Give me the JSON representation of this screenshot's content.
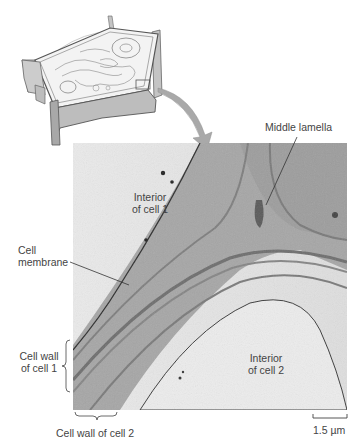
{
  "figure": {
    "type": "plant cell wall micrograph diagram",
    "inset": {
      "description": "3D drawing of plant cell with organelles, boxed region at lower right corner of cell wall"
    },
    "arrow": {
      "from": "inset-box",
      "to": "micrograph",
      "color": "#a9a9a9"
    },
    "labels": {
      "middle_lamella": "Middle lamella",
      "interior_cell1_line1": "Interior",
      "interior_cell1_line2": "of cell 1",
      "cell_membrane_line1": "Cell",
      "cell_membrane_line2": "membrane",
      "cell_wall_1_line1": "Cell wall",
      "cell_wall_1_line2": "of cell 1",
      "interior_cell2_line1": "Interior",
      "interior_cell2_line2": "of cell 2",
      "cell_wall_2": "Cell wall of cell 2",
      "scale_bar": "1.5 µm"
    },
    "colors": {
      "micrograph_bg": "#e6e6e6",
      "wall_tone": "#a3a3a3",
      "dark_band": "#6e6e6e",
      "light_interior": "#eeeeee",
      "inset_gray": "#bdbdbd",
      "line": "#333333"
    }
  }
}
